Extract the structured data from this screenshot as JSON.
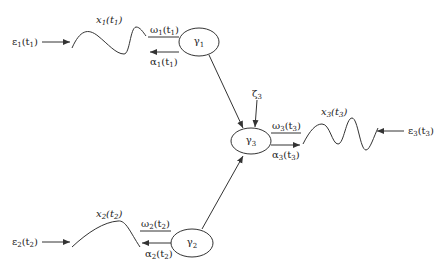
{
  "nodes": {
    "gamma1": {
      "base": "γ",
      "sub": "1"
    },
    "gamma2": {
      "base": "γ",
      "sub": "2"
    },
    "gamma3": {
      "base": "γ",
      "sub": "3"
    }
  },
  "labels": {
    "eps1": {
      "base": "ε",
      "sub": "1",
      "arg": "(t",
      "argsub": "1",
      "close": ")"
    },
    "x1": {
      "base": "x",
      "sub": "1",
      "arg": "(t",
      "argsub": "1",
      "close": ")"
    },
    "omega1": {
      "base": "ω",
      "sub": "1",
      "arg": "(t",
      "argsub": "1",
      "close": ")"
    },
    "alpha1": {
      "base": "α",
      "sub": "1",
      "arg": "(t",
      "argsub": "1",
      "close": ")"
    },
    "eps2": {
      "base": "ε",
      "sub": "2",
      "arg": "(t",
      "argsub": "2",
      "close": ")"
    },
    "x2": {
      "base": "x",
      "sub": "2",
      "arg": "(t",
      "argsub": "2",
      "close": ")"
    },
    "omega2": {
      "base": "ω",
      "sub": "2",
      "arg": "(t",
      "argsub": "2",
      "close": ")"
    },
    "alpha2": {
      "base": "α",
      "sub": "2",
      "arg": "(t",
      "argsub": "2",
      "close": ")"
    },
    "eps3": {
      "base": "ε",
      "sub": "3",
      "arg": "(t",
      "argsub": "3",
      "close": ")"
    },
    "x3": {
      "base": "x",
      "sub": "3",
      "arg": "(t",
      "argsub": "3",
      "close": ")"
    },
    "omega3": {
      "base": "ω",
      "sub": "3",
      "arg": "(t",
      "argsub": "3",
      "close": ")"
    },
    "alpha3": {
      "base": "α",
      "sub": "3",
      "arg": "(t",
      "argsub": "3",
      "close": ")"
    },
    "zeta3": {
      "base": "ζ",
      "sub": "3"
    }
  },
  "colors": {
    "stroke": "#333333",
    "text": "#222222",
    "background": "#ffffff"
  }
}
